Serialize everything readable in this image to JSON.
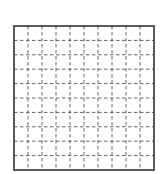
{
  "diagram": {
    "type": "grid",
    "columns": 10,
    "rows": 10,
    "border_color": "#333333",
    "gridline_color": "#555555",
    "gridline_style": "dashed",
    "background_color": "#ffffff"
  }
}
